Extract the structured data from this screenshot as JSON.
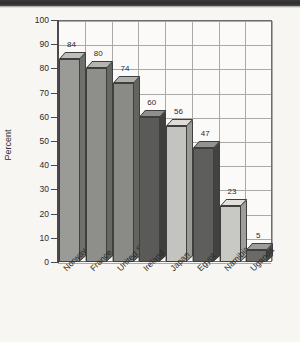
{
  "chart_data": {
    "type": "bar",
    "title": "",
    "xlabel": "",
    "ylabel": "Percent",
    "ylim": [
      0,
      100
    ],
    "ytick_step": 10,
    "yticks": [
      100,
      90,
      80,
      70,
      60,
      50,
      40,
      30,
      20,
      10,
      0
    ],
    "grid": true,
    "legend": "none",
    "value_labels_shown": true,
    "categories": [
      "Norway",
      "France",
      "United States",
      "Ireland",
      "Japan",
      "Egypt",
      "Namibia",
      "Uganda"
    ],
    "values": [
      84,
      80,
      74,
      60,
      56,
      47,
      23,
      5
    ],
    "bar_colors": [
      "#9a9a96",
      "#8e8e8a",
      "#8a8a86",
      "#5a5a58",
      "#c3c3bf",
      "#5e5e5c",
      "#c8c8c4",
      "#6a6a68"
    ],
    "style": "3d-bars-grayscale-scanned"
  },
  "axis": {
    "y_title": "Percent",
    "ticks": [
      {
        "label": "100",
        "value": 100
      },
      {
        "label": "90",
        "value": 90
      },
      {
        "label": "80",
        "value": 80
      },
      {
        "label": "70",
        "value": 70
      },
      {
        "label": "60",
        "value": 60
      },
      {
        "label": "50",
        "value": 50
      },
      {
        "label": "40",
        "value": 40
      },
      {
        "label": "30",
        "value": 30
      },
      {
        "label": "20",
        "value": 20
      },
      {
        "label": "10",
        "value": 10
      },
      {
        "label": "0",
        "value": 0
      }
    ]
  },
  "bars": [
    {
      "category": "Norway",
      "value": 84,
      "value_label": "84",
      "color": "#9a9a96",
      "top": "#bdbdb9",
      "side": "#6f6f6c"
    },
    {
      "category": "France",
      "value": 80,
      "value_label": "80",
      "color": "#8e8e8a",
      "top": "#b4b4b0",
      "side": "#666663"
    },
    {
      "category": "United States",
      "value": 74,
      "value_label": "74",
      "color": "#8a8a86",
      "top": "#b0b0ac",
      "side": "#636360"
    },
    {
      "category": "Ireland",
      "value": 60,
      "value_label": "60",
      "color": "#5a5a58",
      "top": "#8f8f8c",
      "side": "#3f3f3e"
    },
    {
      "category": "Japan",
      "value": 56,
      "value_label": "56",
      "color": "#c3c3bf",
      "top": "#dcdcd8",
      "side": "#9a9a96"
    },
    {
      "category": "Egypt",
      "value": 47,
      "value_label": "47",
      "color": "#5e5e5c",
      "top": "#939390",
      "side": "#424241"
    },
    {
      "category": "Namibia",
      "value": 23,
      "value_label": "23",
      "color": "#c8c8c4",
      "top": "#e0e0dc",
      "side": "#9e9e9a"
    },
    {
      "category": "Uganda",
      "value": 5,
      "value_label": "5",
      "color": "#6a6a68",
      "top": "#9c9c99",
      "side": "#4a4a48"
    }
  ],
  "colors": {
    "page_background": "#f7f6f3",
    "plot_background": "#fbfaf8",
    "gridline": "#a9a9a5",
    "axis": "#4a4a4a",
    "text": "#2b2b2b",
    "scan_band": "#2e2e2e"
  }
}
